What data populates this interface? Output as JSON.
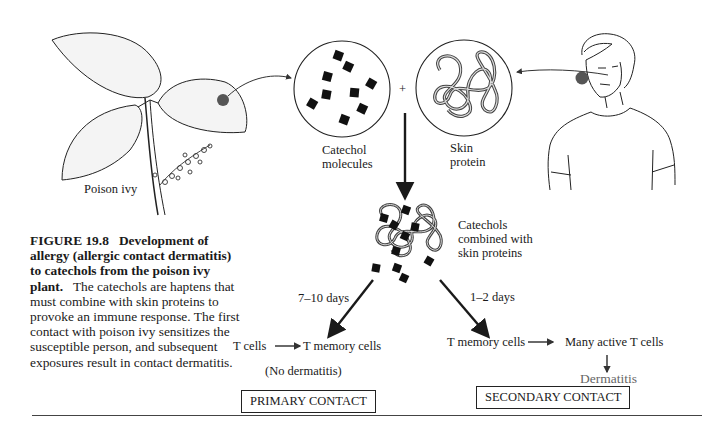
{
  "figure": {
    "number_label": "FIGURE 19.8",
    "title": "Development of allergy (allergic contact dermatitis) to catechols from the poison ivy plant.",
    "body": "The catechols are haptens that must combine with skin proteins to provoke an immune response. The first contact with poison ivy sensitizes the susceptible person, and subsequent exposures result in contact dermatitis."
  },
  "labels": {
    "poison_ivy": "Poison ivy",
    "catechol_line1": "Catechol",
    "catechol_line2": "molecules",
    "skin_line1": "Skin",
    "skin_line2": "protein",
    "plus": "+",
    "combined_line1": "Catechols",
    "combined_line2": "combined with",
    "combined_line3": "skin proteins",
    "primary_days": "7–10 days",
    "secondary_days": "1–2 days",
    "t_cells": "T cells",
    "t_memory_primary": "T memory cells",
    "no_dermatitis": "(No dermatitis)",
    "t_memory_secondary": "T memory cells",
    "many_active": "Many active T cells",
    "dermatitis": "Dermatitis"
  },
  "boxes": {
    "primary": "PRIMARY CONTACT",
    "secondary": "SECONDARY CONTACT"
  },
  "colors": {
    "ink": "#1a1a1a",
    "dot": "#555555",
    "dermatitis_text": "#666666"
  }
}
